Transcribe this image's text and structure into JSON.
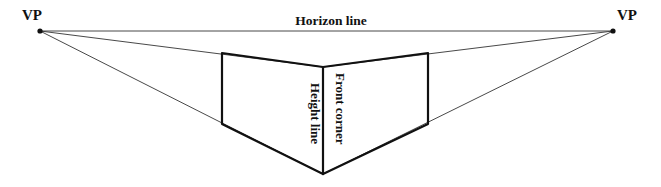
{
  "diagram": {
    "canvas": {
      "width": 661,
      "height": 187,
      "background": "#ffffff"
    },
    "stroke_colors": {
      "heavy": "#111111",
      "light": "#333333"
    },
    "stroke_widths": {
      "heavy": 2.2,
      "light": 0.9
    },
    "labels": {
      "vp_left": "VP",
      "vp_right": "VP",
      "horizon": "Horizon line",
      "height_line": "Height line",
      "front_corner": "Front corner"
    },
    "points": {
      "vp_left": {
        "x": 40,
        "y": 31
      },
      "vp_right": {
        "x": 613,
        "y": 31
      },
      "box_top_left": {
        "x": 222,
        "y": 53
      },
      "box_top_right": {
        "x": 428,
        "y": 53
      },
      "box_bottom_left": {
        "x": 222,
        "y": 124
      },
      "box_bottom_right": {
        "x": 428,
        "y": 124
      },
      "front_top": {
        "x": 323,
        "y": 67
      },
      "front_bottom": {
        "x": 323,
        "y": 174
      }
    },
    "horizon_line": {
      "x1": 40,
      "y1": 31,
      "x2": 613,
      "y2": 31
    },
    "convergence_lines": [
      {
        "name": "left-vp-to-front-top",
        "x1": 40,
        "y1": 31,
        "x2": 323,
        "y2": 67
      },
      {
        "name": "left-vp-to-front-bottom",
        "x1": 40,
        "y1": 31,
        "x2": 323,
        "y2": 174
      },
      {
        "name": "right-vp-to-front-top",
        "x1": 613,
        "y1": 31,
        "x2": 323,
        "y2": 67
      },
      {
        "name": "right-vp-to-front-bottom",
        "x1": 613,
        "y1": 31,
        "x2": 323,
        "y2": 174
      }
    ],
    "heavy_edges": [
      {
        "name": "top-edge-left",
        "x1": 222,
        "y1": 53,
        "x2": 323,
        "y2": 67
      },
      {
        "name": "top-edge-right",
        "x1": 323,
        "y1": 67,
        "x2": 428,
        "y2": 53
      },
      {
        "name": "bottom-edge-left",
        "x1": 222,
        "y1": 124,
        "x2": 323,
        "y2": 174
      },
      {
        "name": "bottom-edge-right",
        "x1": 323,
        "y1": 174,
        "x2": 428,
        "y2": 124
      },
      {
        "name": "left-vertical-edge",
        "x1": 222,
        "y1": 53,
        "x2": 222,
        "y2": 124
      },
      {
        "name": "right-vertical-edge",
        "x1": 428,
        "y1": 53,
        "x2": 428,
        "y2": 124
      },
      {
        "name": "front-corner-vertical",
        "x1": 323,
        "y1": 67,
        "x2": 323,
        "y2": 174
      }
    ],
    "vp_dot_radius": 2.6,
    "label_positions": {
      "vp_left": {
        "x": 22,
        "y": 20
      },
      "vp_right": {
        "x": 617,
        "y": 20
      },
      "horizon": {
        "x": 331,
        "y": 25
      },
      "height_line": {
        "x": 311,
        "y": 83
      },
      "front_corner": {
        "x": 336,
        "y": 73
      }
    }
  }
}
